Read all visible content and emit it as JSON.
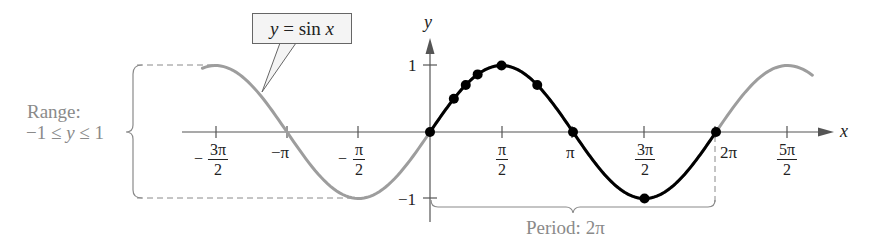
{
  "chart_data": {
    "type": "line",
    "title": "y = sin x",
    "function": "sin(x)",
    "xlabel": "x",
    "ylabel": "y",
    "xlim": [
      -5.0,
      8.4
    ],
    "ylim": [
      -1,
      1
    ],
    "x_ticks": [
      "-3π/2",
      "-π",
      "-π/2",
      "π/2",
      "π",
      "3π/2",
      "2π",
      "5π/2"
    ],
    "x_tick_values": [
      -4.712,
      -3.1416,
      -1.5708,
      1.5708,
      3.1416,
      4.712,
      6.2832,
      7.854
    ],
    "y_ticks": [
      "1",
      "-1"
    ],
    "y_tick_values": [
      1,
      -1
    ],
    "series": [
      {
        "name": "sin x (one period, highlighted)",
        "color": "#000000",
        "x_range": [
          0,
          6.2832
        ]
      },
      {
        "name": "sin x (continuation)",
        "color": "#9a9a9a",
        "x_range": [
          -5.0,
          8.4
        ]
      }
    ],
    "points": [
      {
        "x": "0",
        "y": 0
      },
      {
        "x": "π/6",
        "y": 0.5
      },
      {
        "x": "π/4",
        "y": 0.707
      },
      {
        "x": "π/3",
        "y": 0.866
      },
      {
        "x": "π/2",
        "y": 1
      },
      {
        "x": "3π/4",
        "y": 0.707
      },
      {
        "x": "π",
        "y": 0
      },
      {
        "x": "3π/2",
        "y": -1
      },
      {
        "x": "2π",
        "y": 0
      }
    ],
    "annotations": {
      "callout": "y = sin x",
      "range_label_line1": "Range:",
      "range_label_line2": "−1 ≤ y ≤ 1",
      "period_label": "Period: 2π"
    },
    "grid": false,
    "legend": "none"
  },
  "labels": {
    "callout_y": "y",
    "callout_eq": " = sin ",
    "callout_x": "x",
    "axis_x": "x",
    "axis_y": "y",
    "y_tick_1": "1",
    "y_tick_neg1": "−1",
    "range_line1": "Range:",
    "range_line2_a": "−1 ≤ ",
    "range_line2_y": "y",
    "range_line2_b": " ≤ 1",
    "period": "Period: 2π",
    "tick_neg_3pi_2_num": "3π",
    "tick_neg_3pi_2_den": "2",
    "tick_neg_pi": "−π",
    "tick_neg_pi_2_num": "π",
    "tick_neg_pi_2_den": "2",
    "tick_pi_2_num": "π",
    "tick_pi_2_den": "2",
    "tick_pi": "π",
    "tick_3pi_2_num": "3π",
    "tick_3pi_2_den": "2",
    "tick_2pi": "2π",
    "tick_5pi_2_num": "5π",
    "tick_5pi_2_den": "2",
    "minus": "−"
  }
}
